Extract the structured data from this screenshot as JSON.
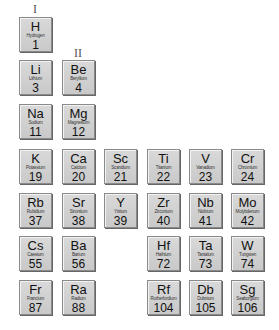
{
  "group_labels": [
    {
      "text": "I",
      "x": 18,
      "y": 2
    },
    {
      "text": "II",
      "x": 61,
      "y": 46
    }
  ],
  "elements": [
    {
      "symbol": "H",
      "name": "Hydrogen",
      "number": "1",
      "col": 0,
      "row": 0
    },
    {
      "symbol": "Li",
      "name": "Lithium",
      "number": "3",
      "col": 0,
      "row": 1
    },
    {
      "symbol": "Be",
      "name": "Beryllium",
      "number": "4",
      "col": 1,
      "row": 1
    },
    {
      "symbol": "Na",
      "name": "Sodium",
      "number": "11",
      "col": 0,
      "row": 2
    },
    {
      "symbol": "Mg",
      "name": "Magnesium",
      "number": "12",
      "col": 1,
      "row": 2
    },
    {
      "symbol": "K",
      "name": "Potassium",
      "number": "19",
      "col": 0,
      "row": 3
    },
    {
      "symbol": "Ca",
      "name": "Calcium",
      "number": "20",
      "col": 1,
      "row": 3
    },
    {
      "symbol": "Sc",
      "name": "Scandium",
      "number": "21",
      "col": 2,
      "row": 3
    },
    {
      "symbol": "Ti",
      "name": "Titanium",
      "number": "22",
      "col": 3,
      "row": 3
    },
    {
      "symbol": "V",
      "name": "Vanadium",
      "number": "23",
      "col": 4,
      "row": 3
    },
    {
      "symbol": "Cr",
      "name": "Chromium",
      "number": "24",
      "col": 5,
      "row": 3
    },
    {
      "symbol": "Rb",
      "name": "Rubidium",
      "number": "37",
      "col": 0,
      "row": 4
    },
    {
      "symbol": "Sr",
      "name": "Strontium",
      "number": "38",
      "col": 1,
      "row": 4
    },
    {
      "symbol": "Y",
      "name": "Yttrium",
      "number": "39",
      "col": 2,
      "row": 4
    },
    {
      "symbol": "Zr",
      "name": "Zirconium",
      "number": "40",
      "col": 3,
      "row": 4
    },
    {
      "symbol": "Nb",
      "name": "Niobium",
      "number": "41",
      "col": 4,
      "row": 4
    },
    {
      "symbol": "Mo",
      "name": "Molybdenum",
      "number": "42",
      "col": 5,
      "row": 4
    },
    {
      "symbol": "Cs",
      "name": "Caesium",
      "number": "55",
      "col": 0,
      "row": 5
    },
    {
      "symbol": "Ba",
      "name": "Barium",
      "number": "56",
      "col": 1,
      "row": 5
    },
    {
      "symbol": "Hf",
      "name": "Hafnium",
      "number": "72",
      "col": 3,
      "row": 5
    },
    {
      "symbol": "Ta",
      "name": "Tantalum",
      "number": "73",
      "col": 4,
      "row": 5
    },
    {
      "symbol": "W",
      "name": "Tungsten",
      "number": "74",
      "col": 5,
      "row": 5
    },
    {
      "symbol": "Fr",
      "name": "Francium",
      "number": "87",
      "col": 0,
      "row": 6
    },
    {
      "symbol": "Ra",
      "name": "Radium",
      "number": "88",
      "col": 1,
      "row": 6
    },
    {
      "symbol": "Rf",
      "name": "Rutherfordium",
      "number": "104",
      "col": 3,
      "row": 6
    },
    {
      "symbol": "Db",
      "name": "Dubnium",
      "number": "105",
      "col": 4,
      "row": 6
    },
    {
      "symbol": "Sg",
      "name": "Seaborgium",
      "number": "106",
      "col": 5,
      "row": 6
    }
  ]
}
